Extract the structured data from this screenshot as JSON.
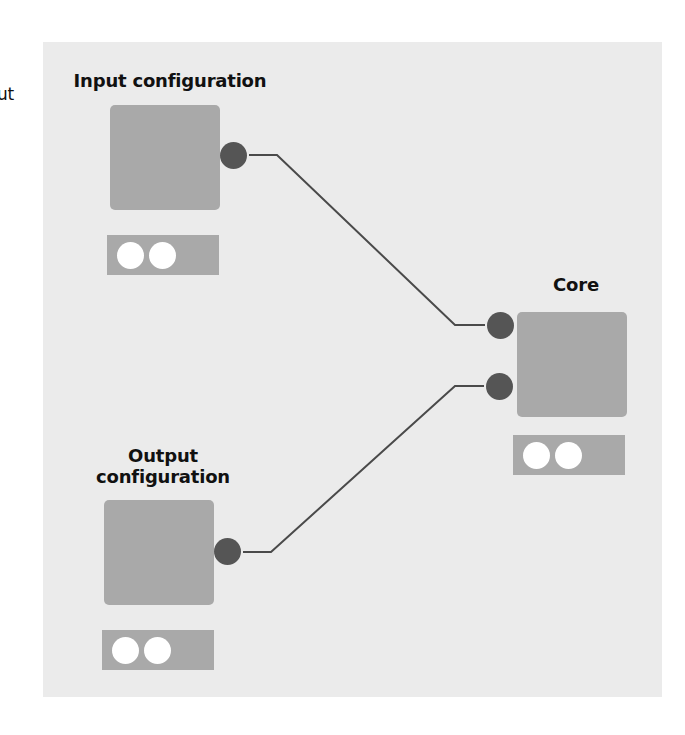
{
  "edge_label_fragment": "ut",
  "colors": {
    "panel": "#ebebeb",
    "box": "#a9a9a9",
    "port": "#555555",
    "wire": "#4a4a4a",
    "led": "#ffffff"
  },
  "nodes": {
    "input": {
      "label": "Input configuration",
      "ports": [
        "out"
      ],
      "leds": 2
    },
    "output": {
      "label_line1": "Output",
      "label_line2": "configuration",
      "ports": [
        "out"
      ],
      "leds": 2
    },
    "core": {
      "label": "Core",
      "ports": [
        "in-1",
        "in-2"
      ],
      "leds": 2
    }
  },
  "connections": [
    {
      "from": "input.out",
      "to": "core.in-1"
    },
    {
      "from": "output.out",
      "to": "core.in-2"
    }
  ]
}
